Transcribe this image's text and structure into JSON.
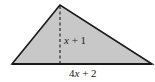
{
  "diagram": {
    "type": "triangle",
    "fill_color": "#c8c8c8",
    "stroke_color": "#1a1a1a",
    "vertices": {
      "apex": [
        60,
        5
      ],
      "base_left": [
        12,
        64
      ],
      "base_right": [
        152,
        64
      ]
    },
    "altitude": {
      "style": "dashed",
      "from": [
        60,
        5
      ],
      "to": [
        60,
        64
      ]
    },
    "labels": {
      "height": {
        "var": "x",
        "rest": " + 1"
      },
      "base": {
        "coef": "4",
        "var": "x",
        "rest": " + 2"
      }
    }
  }
}
